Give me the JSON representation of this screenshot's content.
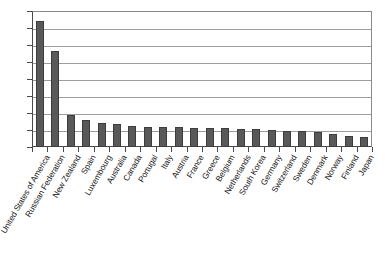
{
  "chart_data": {
    "type": "bar",
    "title": "",
    "subtitle": "",
    "xlabel": "",
    "ylabel": "",
    "ylim": [
      0,
      800
    ],
    "ytick_step": 100,
    "yticks": [
      0,
      100,
      200,
      300,
      400,
      500,
      600,
      700,
      800
    ],
    "ytick_labels": [
      "0",
      "100",
      "200",
      "300",
      "400",
      "500",
      "600",
      "700",
      "800"
    ],
    "grid": true,
    "legend": false,
    "legend_position": "none",
    "bar_color": "#595959",
    "bar_edge_color": "#3d3d3d",
    "gridline_color": "#9d9d9d",
    "axis_color": "#4a4a4a",
    "label_rotation_degrees": 60,
    "categories": [
      "United States of America",
      "Russian Federation",
      "New Zealand",
      "Spain",
      "Luxembourg",
      "Australia",
      "Canada",
      "Portugal",
      "Italy",
      "Austria",
      "France",
      "Greece",
      "Belgium",
      "Netherlands",
      "South Korea",
      "Germany",
      "Switzerland",
      "Sweden",
      "Denmark",
      "Norway",
      "Finland",
      "Japan"
    ],
    "values": [
      740,
      565,
      190,
      160,
      140,
      133,
      126,
      120,
      118,
      116,
      114,
      112,
      110,
      108,
      105,
      100,
      96,
      92,
      88,
      78,
      64,
      60
    ]
  }
}
